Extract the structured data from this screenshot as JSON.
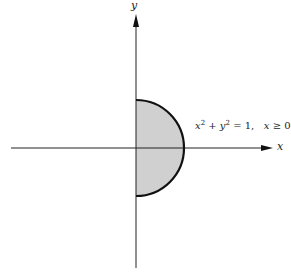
{
  "diagram": {
    "axes": {
      "x_label": "x",
      "y_label": "y"
    },
    "region": {
      "shape": "right half-disk",
      "fill_color": "#d0d0d0",
      "stroke_color": "#111111"
    },
    "annotation": {
      "x": "x",
      "exp1": "2",
      "plus": " + ",
      "y": "y",
      "exp2": "2",
      "eq_one": " = 1,   ",
      "x2": "x",
      "cond": " ≥ 0"
    }
  }
}
